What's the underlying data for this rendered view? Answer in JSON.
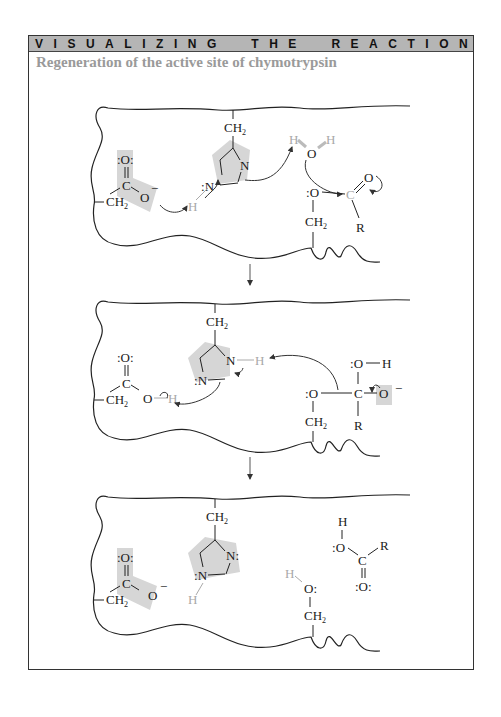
{
  "header": {
    "banner_words": [
      "VISUALIZING",
      "THE",
      "REACTION"
    ],
    "banner_letters": [
      "V",
      "I",
      "S",
      "U",
      "A",
      "L",
      "I",
      "Z",
      "I",
      "N",
      "G",
      "T",
      "H",
      "E",
      "R",
      "E",
      "A",
      "C",
      "T",
      "I",
      "O",
      "N"
    ],
    "subtitle": "Regeneration of the active site of chymotrypsin"
  },
  "colors": {
    "banner_bg": "#b5b5b5",
    "subtitle": "#9a9a9a",
    "highlight": "#d6d6d6",
    "grey_atom": "#a8a8a8",
    "ink": "#1a1a1a"
  },
  "panels": [
    {
      "id": "panel-1",
      "label": "Acyl-enzyme + water attack",
      "asp": {
        "carbonyl_O": ":O:",
        "C": "C",
        "O_minus": "O",
        "charge": "−",
        "CH2": "CH",
        "sub": "2",
        "highlighted": true
      },
      "his": {
        "CH2": "CH",
        "sub": "2",
        "N1": "N",
        "N3": "N",
        "H": "H",
        "highlighted": true
      },
      "water": {
        "H1": "H",
        "O": "O",
        "H2": "H"
      },
      "ser": {
        "O": "O",
        "CH2": "CH",
        "sub": "2"
      },
      "acyl": {
        "C": "C",
        "O": "O",
        "R": "R"
      }
    },
    {
      "id": "panel-2",
      "label": "Tetrahedral intermediate",
      "asp": {
        "carbonyl_O": ":O:",
        "C": "C",
        "O": "O",
        "H": "H",
        "CH2": "CH",
        "sub": "2",
        "highlighted": false
      },
      "his": {
        "CH2": "CH",
        "sub": "2",
        "N1": "N",
        "N3": "N",
        "H": "H",
        "highlighted": true
      },
      "ser": {
        "O": "O",
        "CH2": "CH",
        "sub": "2"
      },
      "tetra": {
        "OH_O": "O",
        "OH_H": "H",
        "C": "C",
        "O_minus": "O",
        "charge": "−",
        "R": "R"
      }
    },
    {
      "id": "panel-3",
      "label": "Regenerated active site + carboxylic acid",
      "asp": {
        "carbonyl_O": ":O:",
        "C": "C",
        "O_minus": "O",
        "charge": "−",
        "CH2": "CH",
        "sub": "2",
        "highlighted": true
      },
      "his": {
        "CH2": "CH",
        "sub": "2",
        "N1": "N",
        "N3": "N",
        "H": "H",
        "highlighted": true
      },
      "ser": {
        "H": "H",
        "O": "O",
        "CH2": "CH",
        "sub": "2"
      },
      "acid": {
        "H": "H",
        "O": "O",
        "C": "C",
        "R": "R",
        "carbonyl_O": ":O:"
      }
    }
  ],
  "arrows": {
    "between_panels": 2
  }
}
